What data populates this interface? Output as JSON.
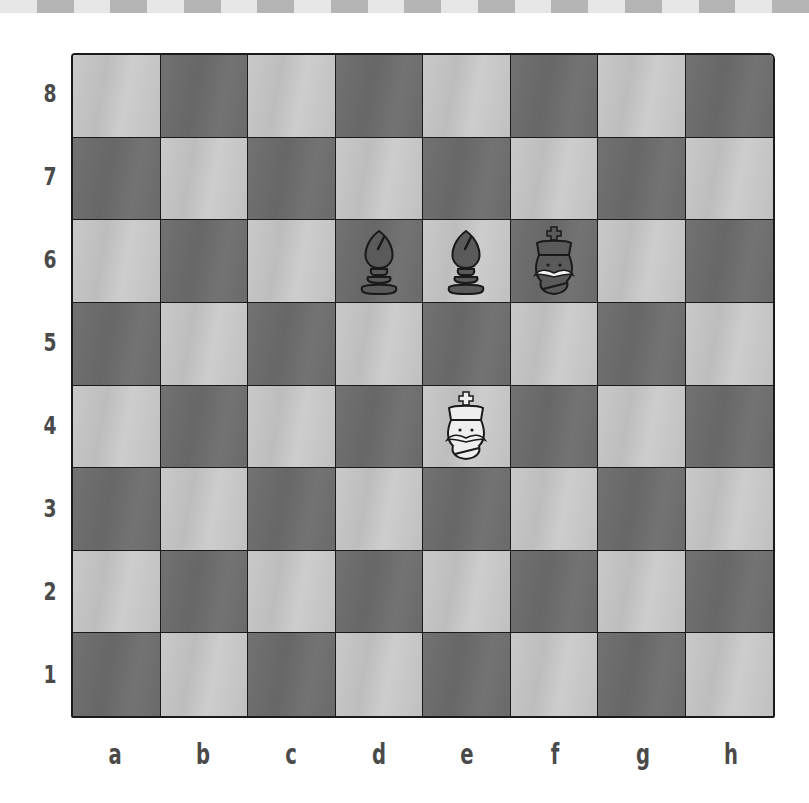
{
  "colors": {
    "light_square": "#c4c4c4",
    "dark_square": "#6e6e6e",
    "grid_line": "#1a1a1a",
    "label": "#4a4a4a",
    "strip_light": "#e6e6e6",
    "strip_dark": "#b4b4b4"
  },
  "board": {
    "orientation": "white-bottom",
    "ranks": [
      "8",
      "7",
      "6",
      "5",
      "4",
      "3",
      "2",
      "1"
    ],
    "files": [
      "a",
      "b",
      "c",
      "d",
      "e",
      "f",
      "g",
      "h"
    ],
    "pieces": [
      {
        "square": "d6",
        "color": "black",
        "type": "bishop",
        "icon": "black-bishop-icon"
      },
      {
        "square": "e6",
        "color": "black",
        "type": "bishop",
        "icon": "black-bishop-icon"
      },
      {
        "square": "f6",
        "color": "black",
        "type": "king",
        "icon": "black-king-icon"
      },
      {
        "square": "e4",
        "color": "white",
        "type": "king",
        "icon": "white-king-icon"
      }
    ]
  }
}
